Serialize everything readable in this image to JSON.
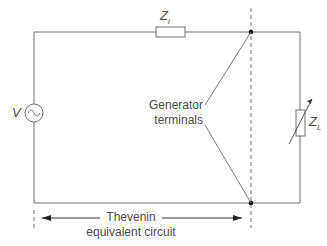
{
  "diagram": {
    "source": {
      "label": "V",
      "symbol": "ac-source"
    },
    "internal_impedance": {
      "label": "Z",
      "subscript": "i"
    },
    "load_impedance": {
      "label": "Z",
      "subscript": "L",
      "variable": true
    },
    "terminals_label_line1": "Generator",
    "terminals_label_line2": "terminals",
    "thevenin_label_line1": "Thevenin",
    "thevenin_label_line2": "equivalent circuit",
    "colors": {
      "wire": "#6e6e6e",
      "text": "#4a4a4a",
      "node": "#111111"
    }
  }
}
